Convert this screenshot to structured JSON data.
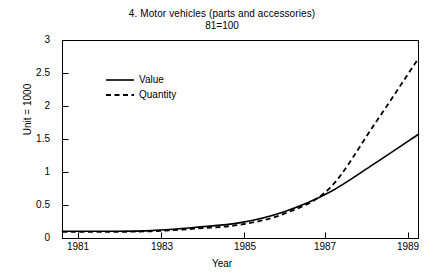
{
  "chart_data": {
    "type": "line",
    "title": "4. Motor vehicles (parts and accessories)",
    "subtitle": "81=100",
    "xlabel": "Year",
    "ylabel": "Unit = 1000",
    "xlim": [
      1981,
      1989
    ],
    "ylim": [
      0,
      3
    ],
    "grid": false,
    "legend_position": "upper left",
    "xticks": [
      1981,
      1983,
      1985,
      1987,
      1989
    ],
    "xtick_labels": [
      "1981",
      "1983",
      "1985",
      "1987",
      "1989"
    ],
    "yticks": [
      0,
      0.5,
      1,
      1.5,
      2,
      2.5,
      3
    ],
    "ytick_labels": [
      "0",
      "0.5",
      "1",
      "1.5",
      "2",
      "2.5",
      "3"
    ],
    "x": [
      1981,
      1982,
      1983,
      1984,
      1985,
      1986,
      1987,
      1988,
      1989
    ],
    "series": [
      {
        "name": "Value",
        "style": "solid",
        "color": "#000000",
        "values": [
          0.11,
          0.11,
          0.12,
          0.17,
          0.24,
          0.41,
          0.7,
          1.13,
          1.58
        ]
      },
      {
        "name": "Quantity",
        "style": "dashed",
        "color": "#000000",
        "values": [
          0.1,
          0.1,
          0.11,
          0.15,
          0.21,
          0.38,
          0.76,
          1.72,
          2.73
        ]
      }
    ]
  },
  "legend": {
    "items": [
      {
        "label": "Value",
        "style": "solid"
      },
      {
        "label": "Quantity",
        "style": "dashed"
      }
    ]
  }
}
